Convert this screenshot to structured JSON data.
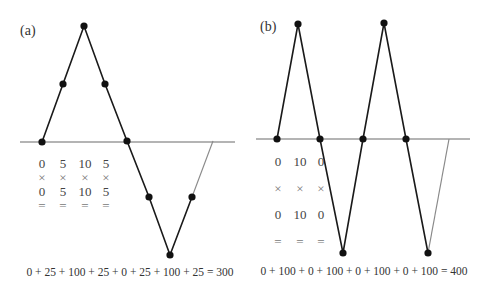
{
  "panels": [
    {
      "id": "a",
      "label": "(a)",
      "baseline": {
        "y": 142,
        "x1": 20,
        "x2": 235
      },
      "path_points": [
        [
          42,
          142
        ],
        [
          63,
          84
        ],
        [
          84,
          26
        ],
        [
          105,
          84
        ],
        [
          127,
          141
        ],
        [
          149,
          197
        ],
        [
          170,
          255
        ],
        [
          192,
          197
        ]
      ],
      "closing_segment": [
        [
          192,
          197
        ],
        [
          213,
          141
        ]
      ],
      "dots": [
        [
          42,
          142
        ],
        [
          63,
          84
        ],
        [
          84,
          26
        ],
        [
          105,
          84
        ],
        [
          127,
          141
        ],
        [
          149,
          197
        ],
        [
          170,
          255
        ],
        [
          192,
          197
        ]
      ],
      "table": {
        "columns_x": [
          42,
          63,
          85,
          106
        ],
        "row1": [
          "0",
          "5",
          "10",
          "5"
        ],
        "row2": [
          "×",
          "×",
          "×",
          "×"
        ],
        "row3": [
          "0",
          "5",
          "10",
          "5"
        ],
        "row4": [
          "=",
          "=",
          "=",
          "="
        ],
        "rows_y": [
          168,
          182,
          196,
          210
        ]
      },
      "equation": "0  +  25 + 100 + 25  +  0  +  25 + 100 + 25 = 300",
      "equation_pos": {
        "x": 130,
        "y": 276
      }
    },
    {
      "id": "b",
      "label": "(b)",
      "baseline": {
        "y": 139,
        "x1": 256,
        "x2": 470
      },
      "path_points": [
        [
          277,
          139
        ],
        [
          298,
          24
        ],
        [
          320,
          139
        ],
        [
          343,
          253
        ],
        [
          363,
          139
        ],
        [
          384,
          23
        ],
        [
          406,
          139
        ],
        [
          428,
          253
        ]
      ],
      "closing_segment": [
        [
          428,
          253
        ],
        [
          449,
          139
        ]
      ],
      "dots": [
        [
          277,
          139
        ],
        [
          298,
          24
        ],
        [
          320,
          139
        ],
        [
          343,
          253
        ],
        [
          363,
          139
        ],
        [
          384,
          23
        ],
        [
          406,
          139
        ],
        [
          428,
          253
        ]
      ],
      "table": {
        "columns_x": [
          278,
          300,
          321
        ],
        "row1": [
          "0",
          "10",
          "0"
        ],
        "row2": [
          "×",
          "×",
          "×"
        ],
        "row3": [
          "0",
          "10",
          "0"
        ],
        "row4": [
          "=",
          "=",
          "="
        ],
        "rows_y": [
          166,
          193,
          219,
          246
        ]
      },
      "equation": "0 + 100 + 0 + 100 + 0 + 100 + 0 + 100 = 400",
      "equation_pos": {
        "x": 364,
        "y": 275
      }
    }
  ],
  "colors": {
    "line": "#1a1a1a",
    "baseline": "#6a6a6a",
    "closing": "#8a8a8a",
    "dot": "#111111"
  }
}
